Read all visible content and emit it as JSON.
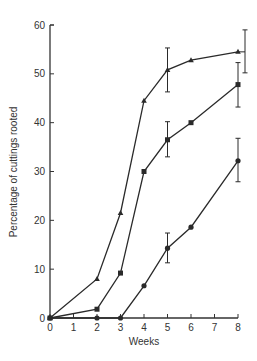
{
  "chart_data": {
    "type": "line",
    "title": "",
    "xlabel": "Weeks",
    "ylabel": "Percentage of cuttings rooted",
    "xlim": [
      0,
      8
    ],
    "ylim": [
      0,
      60
    ],
    "xticks": [
      0,
      1,
      2,
      3,
      4,
      5,
      6,
      7,
      8
    ],
    "yticks": [
      0,
      10,
      20,
      30,
      40,
      50,
      60
    ],
    "grid": false,
    "legend": null,
    "series": [
      {
        "name": "triangle series",
        "marker": "triangle",
        "x": [
          0,
          2,
          3,
          4,
          5,
          6,
          8
        ],
        "values": [
          0,
          8,
          21.5,
          44.5,
          50.8,
          52.8,
          54.5
        ],
        "error_bars": [
          {
            "x": 5,
            "low": 46.3,
            "high": 55.3
          },
          {
            "x": 8,
            "low": 50.2,
            "high": 59
          }
        ]
      },
      {
        "name": "square series",
        "marker": "square",
        "x": [
          0,
          2,
          3,
          4,
          5,
          6,
          8
        ],
        "values": [
          0,
          1.8,
          9.2,
          30,
          36.5,
          40,
          47.8
        ],
        "error_bars": [
          {
            "x": 5,
            "low": 33,
            "high": 40.2
          },
          {
            "x": 8,
            "low": 43.2,
            "high": 52.3
          }
        ]
      },
      {
        "name": "circle series",
        "marker": "circle",
        "x": [
          0,
          2,
          3,
          4,
          5,
          6,
          8
        ],
        "values": [
          0,
          0,
          0,
          6.6,
          14.3,
          18.6,
          32.2
        ],
        "error_bars": [
          {
            "x": 5,
            "low": 11.3,
            "high": 17.4
          },
          {
            "x": 8,
            "low": 27.9,
            "high": 36.8
          }
        ]
      }
    ]
  },
  "colors": {
    "line": "#2a2a2a",
    "axis": "#333333",
    "background": "#ffffff"
  }
}
